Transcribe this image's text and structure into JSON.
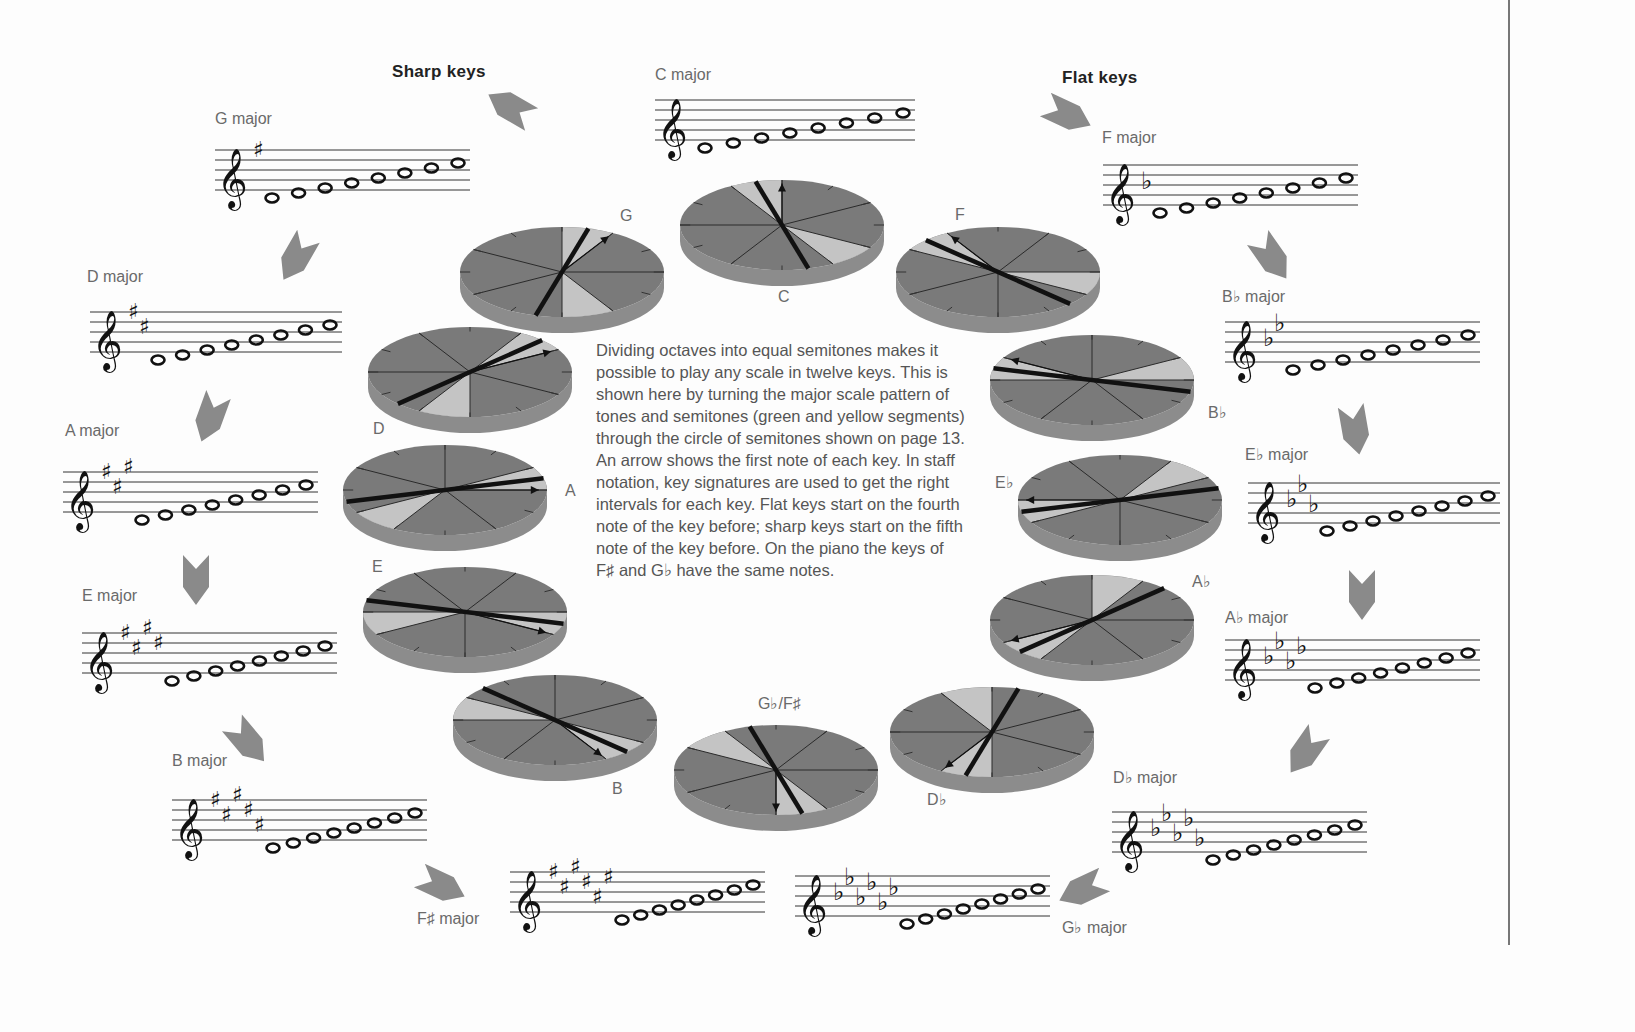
{
  "headings": {
    "sharp_keys": "Sharp keys",
    "flat_keys": "Flat keys"
  },
  "body_text": "Dividing octaves into equal semitones makes it possible to play any scale in twelve keys. This is shown here by turning the major scale pattern of tones and semitones (green and yellow segments) through the circle of semitones shown on page 13. An arrow shows the first note of each key. In staff notation, key signatures are used to get the right intervals for each key. Flat keys start on the fourth note of the key before; sharp keys start on the fifth note of the key before. On the piano the keys of F♯ and G♭ have the same notes.",
  "colors": {
    "disc_top": "#7a7a7a",
    "disc_light": "#c4c4c4",
    "disc_side": "#8c8c8c",
    "arrow_chevron": "#8a8a8a",
    "staff_line": "#333333",
    "rule": "#777777"
  },
  "staves": [
    {
      "id": "c",
      "label": "C major",
      "accidental": "none",
      "count": 0,
      "x": 655,
      "y": 100,
      "w": 260,
      "label_x": 655,
      "label_y": 66
    },
    {
      "id": "g",
      "label": "G major",
      "accidental": "sharp",
      "count": 1,
      "x": 215,
      "y": 150,
      "w": 255,
      "label_x": 215,
      "label_y": 110
    },
    {
      "id": "d",
      "label": "D major",
      "accidental": "sharp",
      "count": 2,
      "x": 90,
      "y": 312,
      "w": 252,
      "label_x": 87,
      "label_y": 268
    },
    {
      "id": "a",
      "label": "A major",
      "accidental": "sharp",
      "count": 3,
      "x": 63,
      "y": 472,
      "w": 255,
      "label_x": 65,
      "label_y": 422
    },
    {
      "id": "e",
      "label": "E major",
      "accidental": "sharp",
      "count": 4,
      "x": 82,
      "y": 633,
      "w": 255,
      "label_x": 82,
      "label_y": 587
    },
    {
      "id": "b",
      "label": "B major",
      "accidental": "sharp",
      "count": 5,
      "x": 172,
      "y": 800,
      "w": 255,
      "label_x": 172,
      "label_y": 752
    },
    {
      "id": "fs",
      "label": "F♯ major",
      "accidental": "sharp",
      "count": 6,
      "x": 510,
      "y": 872,
      "w": 255,
      "label_x": 417,
      "label_y": 910
    },
    {
      "id": "gb",
      "label": "G♭ major",
      "accidental": "flat",
      "count": 6,
      "x": 795,
      "y": 876,
      "w": 255,
      "label_x": 1062,
      "label_y": 918
    },
    {
      "id": "db",
      "label": "D♭ major",
      "accidental": "flat",
      "count": 5,
      "x": 1112,
      "y": 812,
      "w": 255,
      "label_x": 1113,
      "label_y": 768
    },
    {
      "id": "ab",
      "label": "A♭ major",
      "accidental": "flat",
      "count": 4,
      "x": 1225,
      "y": 640,
      "w": 255,
      "label_x": 1225,
      "label_y": 608
    },
    {
      "id": "eb",
      "label": "E♭ major",
      "accidental": "flat",
      "count": 3,
      "x": 1248,
      "y": 483,
      "w": 252,
      "label_x": 1245,
      "label_y": 445
    },
    {
      "id": "bb",
      "label": "B♭ major",
      "accidental": "flat",
      "count": 2,
      "x": 1225,
      "y": 322,
      "w": 255,
      "label_x": 1222,
      "label_y": 287
    },
    {
      "id": "f",
      "label": "F major",
      "accidental": "flat",
      "count": 1,
      "x": 1103,
      "y": 165,
      "w": 255,
      "label_x": 1102,
      "label_y": 129
    }
  ],
  "discs": [
    {
      "id": "c",
      "label": "C",
      "cx": 782,
      "cy": 225,
      "rx": 102,
      "ry": 45,
      "angle": 0,
      "label_x": 778,
      "label_y": 288
    },
    {
      "id": "g",
      "label": "G",
      "cx": 562,
      "cy": 272,
      "rx": 102,
      "ry": 45,
      "angle": 30,
      "label_x": 620,
      "label_y": 207
    },
    {
      "id": "d",
      "label": "D",
      "cx": 470,
      "cy": 372,
      "rx": 102,
      "ry": 45,
      "angle": 60,
      "label_x": 373,
      "label_y": 420
    },
    {
      "id": "a",
      "label": "A",
      "cx": 445,
      "cy": 490,
      "rx": 102,
      "ry": 45,
      "angle": 90,
      "label_x": 565,
      "label_y": 482
    },
    {
      "id": "e",
      "label": "E",
      "cx": 465,
      "cy": 612,
      "rx": 102,
      "ry": 45,
      "angle": 120,
      "label_x": 372,
      "label_y": 558
    },
    {
      "id": "b",
      "label": "B",
      "cx": 555,
      "cy": 720,
      "rx": 102,
      "ry": 45,
      "angle": 150,
      "label_x": 612,
      "label_y": 780
    },
    {
      "id": "gbfs",
      "label": "G♭/F♯",
      "cx": 776,
      "cy": 770,
      "rx": 102,
      "ry": 45,
      "angle": 180,
      "label_x": 758,
      "label_y": 694
    },
    {
      "id": "db",
      "label": "D♭",
      "cx": 992,
      "cy": 732,
      "rx": 102,
      "ry": 45,
      "angle": 210,
      "label_x": 927,
      "label_y": 790
    },
    {
      "id": "ab",
      "label": "A♭",
      "cx": 1092,
      "cy": 620,
      "rx": 102,
      "ry": 45,
      "angle": 240,
      "label_x": 1192,
      "label_y": 572
    },
    {
      "id": "eb",
      "label": "E♭",
      "cx": 1120,
      "cy": 500,
      "rx": 102,
      "ry": 45,
      "angle": 270,
      "label_x": 995,
      "label_y": 473
    },
    {
      "id": "bbd",
      "label": "B♭",
      "cx": 1092,
      "cy": 380,
      "rx": 102,
      "ry": 45,
      "angle": 300,
      "label_x": 1208,
      "label_y": 403
    },
    {
      "id": "f",
      "label": "F",
      "cx": 998,
      "cy": 272,
      "rx": 102,
      "ry": 45,
      "angle": 330,
      "label_x": 955,
      "label_y": 206
    }
  ],
  "chevrons": [
    {
      "x": 510,
      "y": 107,
      "rot": -150
    },
    {
      "x": 296,
      "y": 258,
      "rot": 120
    },
    {
      "x": 210,
      "y": 418,
      "rot": 110
    },
    {
      "x": 196,
      "y": 580,
      "rot": 90
    },
    {
      "x": 248,
      "y": 742,
      "rot": 50
    },
    {
      "x": 442,
      "y": 886,
      "rot": 25
    },
    {
      "x": 1082,
      "y": 890,
      "rot": 155
    },
    {
      "x": 1305,
      "y": 752,
      "rot": 125
    },
    {
      "x": 1362,
      "y": 595,
      "rot": 90
    },
    {
      "x": 1355,
      "y": 430,
      "rot": 80
    },
    {
      "x": 1272,
      "y": 258,
      "rot": 55
    },
    {
      "x": 1068,
      "y": 115,
      "rot": 25
    }
  ]
}
